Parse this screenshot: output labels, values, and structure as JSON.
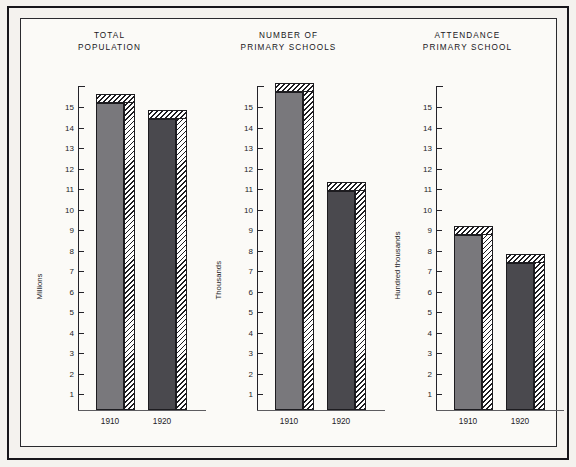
{
  "page": {
    "background_color": "#f4f2ee",
    "panel_color": "#fbfaf7",
    "border_color": "#17161a"
  },
  "series_colors": {
    "1910": "#79787c",
    "1920": "#4a494e",
    "hatch": "#1d1c20"
  },
  "axis": {
    "ticks": [
      15,
      14,
      13,
      12,
      11,
      10,
      9,
      8,
      7,
      6,
      5,
      4,
      3,
      2,
      1
    ],
    "min": 0,
    "max": 16.3
  },
  "x_categories": [
    "1910",
    "1920"
  ],
  "chart_data": [
    {
      "type": "bar",
      "title": "TOTAL\nPOPULATION",
      "title_flat": "TOTAL POPULATION",
      "ylabel": "Millions",
      "xlabel": "",
      "categories": [
        "1910",
        "1920"
      ],
      "values": [
        15.2,
        14.4
      ],
      "ylim": [
        0,
        16.3
      ],
      "yticks": [
        1,
        2,
        3,
        4,
        5,
        6,
        7,
        8,
        9,
        10,
        11,
        12,
        13,
        14,
        15
      ],
      "grid": false,
      "legend": "none"
    },
    {
      "type": "bar",
      "title": "NUMBER OF\nPRIMARY SCHOOLS",
      "title_flat": "NUMBER OF PRIMARY SCHOOLS",
      "ylabel": "Thousands",
      "xlabel": "",
      "categories": [
        "1910",
        "1920"
      ],
      "values": [
        15.75,
        10.9
      ],
      "ylim": [
        0,
        16.3
      ],
      "yticks": [
        1,
        2,
        3,
        4,
        5,
        6,
        7,
        8,
        9,
        10,
        11,
        12,
        13,
        14,
        15
      ],
      "grid": false,
      "legend": "none"
    },
    {
      "type": "bar",
      "title": "ATTENDANCE\nPRIMARY SCHOOL",
      "title_flat": "ATTENDANCE PRIMARY SCHOOL",
      "ylabel": "Hundred thousands",
      "xlabel": "",
      "categories": [
        "1910",
        "1920"
      ],
      "values": [
        8.75,
        7.4
      ],
      "ylim": [
        0,
        16.3
      ],
      "yticks": [
        1,
        2,
        3,
        4,
        5,
        6,
        7,
        8,
        9,
        10,
        11,
        12,
        13,
        14,
        15
      ],
      "grid": false,
      "legend": "none"
    }
  ]
}
